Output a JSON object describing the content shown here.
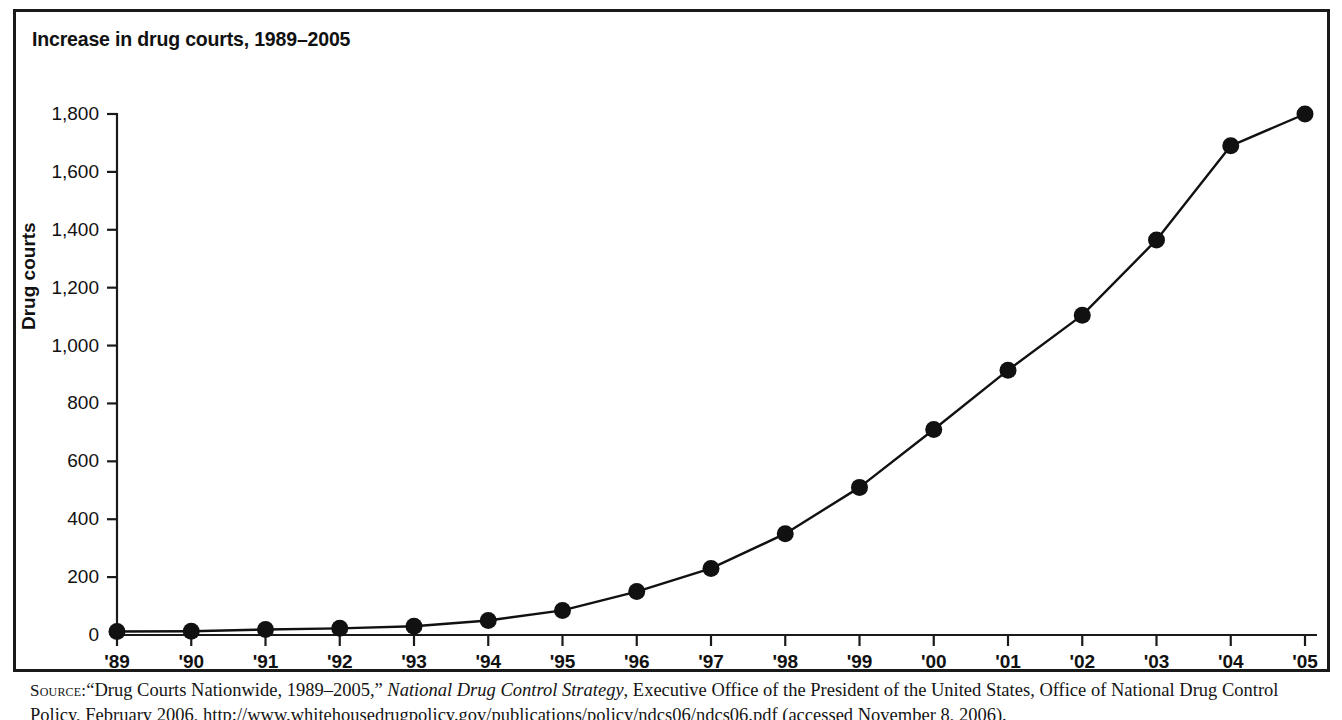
{
  "figure": {
    "title": "Increase in drug courts, 1989–2005",
    "border_color": "#1a1a1a",
    "background": "#ffffff"
  },
  "source": {
    "kicker": "Source:",
    "line1_part1": "“Drug Courts Nationwide, 1989–2005,” ",
    "italic_title": "National Drug Control Strategy",
    "line1_part2": ", Executive Office of the President of the United States, Office of National",
    "line2": "Drug Control Policy, February 2006, http://www.whitehousedrugpolicy.gov/publications/policy/ndcs06/ndcs06.pdf (accessed November 8, 2006)."
  },
  "chart_data": {
    "type": "line",
    "title": "Increase in drug courts, 1989–2005",
    "xlabel": "",
    "ylabel": "Drug courts",
    "grid": false,
    "legend": "none",
    "marker": "filled-circle",
    "line_color": "#111111",
    "xlim": [
      1989,
      2005
    ],
    "ylim": [
      0,
      1800
    ],
    "ytick_step": 200,
    "categories": [
      "'89",
      "'90",
      "'91",
      "'92",
      "'93",
      "'94",
      "'95",
      "'96",
      "'97",
      "'98",
      "'99",
      "'00",
      "'01",
      "'02",
      "'03",
      "'04",
      "'05"
    ],
    "x": [
      1989,
      1990,
      1991,
      1992,
      1993,
      1994,
      1995,
      1996,
      1997,
      1998,
      1999,
      2000,
      2001,
      2002,
      2003,
      2004,
      2005
    ],
    "values": [
      12,
      13,
      19,
      23,
      30,
      50,
      85,
      150,
      230,
      350,
      510,
      710,
      915,
      1105,
      1365,
      1690,
      1800
    ],
    "yticks": [
      0,
      200,
      400,
      600,
      800,
      1000,
      1200,
      1400,
      1600,
      1800
    ],
    "ytick_labels": [
      "0",
      "200",
      "400",
      "600",
      "800",
      "1,000",
      "1,200",
      "1,400",
      "1,600",
      "1,800"
    ]
  }
}
